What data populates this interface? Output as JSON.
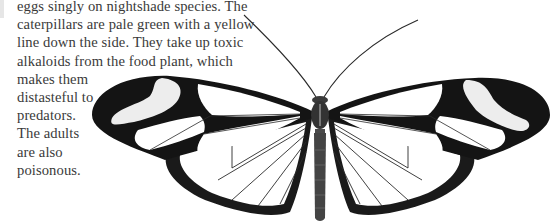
{
  "page": {
    "body_text_lines": [
      "eggs singly on nightshade species. The",
      "caterpillars are pale green with a yellow",
      "line down the side. They take up toxic",
      "alkaloids from the food plant, which",
      "makes them",
      "distasteful to",
      "predators.",
      "The adults",
      "are also",
      "poisonous."
    ]
  },
  "illustration": {
    "subject": "clearwing butterfly (dorsal view)",
    "icon": "butterfly-illustration",
    "colors": {
      "wing_border": "#141414",
      "wing_window": "#ffffff",
      "white_band": "#f2f2f2",
      "vein": "#2a2a2a",
      "body": "#3c3c3c",
      "text": "#3a3a3a"
    }
  }
}
